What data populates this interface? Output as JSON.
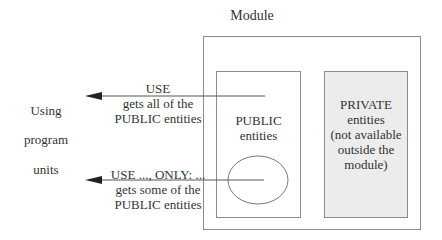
{
  "diagram": {
    "module_title": "Module",
    "public_box": {
      "line1": "PUBLIC",
      "line2": "entities"
    },
    "private_box": {
      "line1": "PRIVATE",
      "line2": "entities",
      "line3": "(not available",
      "line4": "outside the",
      "line5": "module)",
      "fill": "#ececec"
    },
    "using_label": {
      "line1": "Using",
      "line2": "program",
      "line3": "units"
    },
    "arrow_use_all": {
      "line1": "USE",
      "line2": "gets all of the",
      "line3": "PUBLIC entities"
    },
    "arrow_use_only": {
      "line1": "USE ..., ONLY: ...",
      "line2": "gets some of the",
      "line3": "PUBLIC entities"
    },
    "colors": {
      "line": "#8c8c8c",
      "arrow": "#444444",
      "text": "#333333"
    }
  }
}
